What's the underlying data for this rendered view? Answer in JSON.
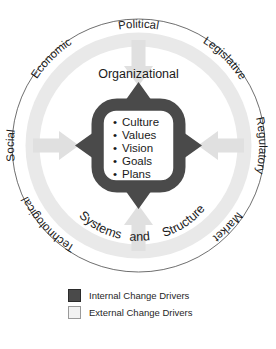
{
  "diagram": {
    "type": "concentric-circle",
    "outer_ring": {
      "name": "External Change Drivers Ring",
      "fill": "#e9e9e9",
      "stroke": "#6f6f6f",
      "labels": [
        {
          "text": "Political",
          "angle_deg": 0
        },
        {
          "text": "Legislative",
          "angle_deg": 45
        },
        {
          "text": "Regulatory",
          "angle_deg": 90
        },
        {
          "text": "Market",
          "angle_deg": 135
        },
        {
          "text": "Technological",
          "angle_deg": 225
        },
        {
          "text": "Social",
          "angle_deg": 270
        },
        {
          "text": "Economic",
          "angle_deg": 315
        }
      ]
    },
    "inner_circle": {
      "name": "Organizational core",
      "fill": "#ffffff",
      "top_label": "Organizational",
      "bottom_label_parts": [
        "Systems",
        "and",
        "Structure"
      ],
      "bottom_label": "Systems and Structure"
    },
    "core_box": {
      "ring_fill": "#4a4a4a",
      "inner_fill": "#ffffff",
      "items": [
        "Culture",
        "Values",
        "Vision",
        "Goals",
        "Plans"
      ]
    },
    "internal_arrows": {
      "color": "#4a4a4a",
      "direction": "outward",
      "count": 4
    },
    "external_arrows": {
      "color": "#e0e0e0",
      "direction": "inward",
      "count": 4
    }
  },
  "legend": {
    "items": [
      {
        "label": "Internal Change Drivers",
        "swatch": "internal",
        "color": "#4a4a4a"
      },
      {
        "label": "External Change Drivers",
        "swatch": "external",
        "color": "#f2f2f2"
      }
    ]
  },
  "caption": {
    "text": ""
  }
}
